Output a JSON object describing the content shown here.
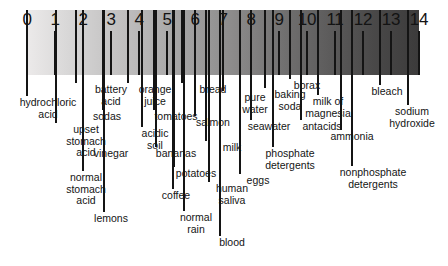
{
  "figure": {
    "name": "ph-scale-diagram",
    "background_color": "#ffffff",
    "bar": {
      "start_color": "#eceaea",
      "end_color": "#3c3b3b",
      "left_px": 27,
      "top_px": 10,
      "width_px": 392,
      "height_px": 65
    },
    "axis": {
      "min": 0,
      "max": 14,
      "tick_labels": [
        "0",
        "1",
        "2",
        "3",
        "4",
        "5",
        "6",
        "7",
        "8",
        "9",
        "10",
        "11",
        "12",
        "13",
        "14"
      ]
    }
  },
  "chart_data": {
    "type": "scatter",
    "title": "",
    "xlabel": "",
    "ylabel": "",
    "xlim": [
      0,
      14
    ],
    "grid": false,
    "legend": "none",
    "categories": [
      "0",
      "1",
      "2",
      "3",
      "4",
      "5",
      "6",
      "7",
      "8",
      "9",
      "10",
      "11",
      "12",
      "13",
      "14"
    ],
    "series": [
      {
        "name": "substances",
        "points": [
          {
            "label": "hydrochloric\nacid",
            "ph": 0.0
          },
          {
            "label": "upset\nstomach\nacid",
            "ph": 1.05
          },
          {
            "label": "battery\nacid",
            "ph": 1.75
          },
          {
            "label": "normal\nstomach\nacid",
            "ph": 2.0
          },
          {
            "label": "sodas",
            "ph": 2.7
          },
          {
            "label": "vinegar",
            "ph": 2.75
          },
          {
            "label": "lemons",
            "ph": 2.75
          },
          {
            "label": "orange\njuice",
            "ph": 3.6
          },
          {
            "label": "acidic\nsoil",
            "ph": 4.1
          },
          {
            "label": "tomatoes",
            "ph": 4.55
          },
          {
            "label": "bananas",
            "ph": 4.6
          },
          {
            "label": "potatoes",
            "ph": 5.25
          },
          {
            "label": "coffee",
            "ph": 5.2
          },
          {
            "label": "bread",
            "ph": 5.55
          },
          {
            "label": "normal\nrain",
            "ph": 5.6
          },
          {
            "label": "salmon",
            "ph": 6.0
          },
          {
            "label": "milk",
            "ph": 6.4
          },
          {
            "label": "human\nsaliva",
            "ph": 6.5
          },
          {
            "label": "blood",
            "ph": 6.9
          },
          {
            "label": "pure\nwater",
            "ph": 7.0
          },
          {
            "label": "eggs",
            "ph": 7.6
          },
          {
            "label": "seawater",
            "ph": 8.0
          },
          {
            "label": "baking\nsoda",
            "ph": 8.5
          },
          {
            "label": "phosphate\ndetergents",
            "ph": 8.8
          },
          {
            "label": "borax",
            "ph": 9.4
          },
          {
            "label": "antacids",
            "ph": 9.8
          },
          {
            "label": "milk of\nmagnesia",
            "ph": 10.4
          },
          {
            "label": "ammonia",
            "ph": 11.2
          },
          {
            "label": "nonphosphate\ndetergents",
            "ph": 11.6
          },
          {
            "label": "bleach",
            "ph": 12.6
          },
          {
            "label": "sodium\nhydroxide",
            "ph": 13.6
          }
        ]
      }
    ]
  },
  "callouts": [
    {
      "name": "callout-hydrochloric-acid",
      "text": "hydrochloric\nacid",
      "ph": 0.0,
      "x": 48,
      "label_y": 97,
      "line_top": 10,
      "line_bottom": 96
    },
    {
      "name": "callout-upset-stomach-acid",
      "text": "upset\nstomach\nacid",
      "ph": 1.05,
      "x": 86,
      "label_y": 124,
      "line_top": 10,
      "line_bottom": 123
    },
    {
      "name": "callout-battery-acid",
      "text": "battery\nacid",
      "ph": 1.75,
      "x": 111,
      "label_y": 84,
      "line_top": 10,
      "line_bottom": 83
    },
    {
      "name": "callout-normal-stomach-acid",
      "text": "normal\nstomach\nacid",
      "ph": 2.0,
      "x": 86,
      "label_y": 172,
      "line_top": 10,
      "line_bottom": 171
    },
    {
      "name": "callout-sodas",
      "text": "sodas",
      "ph": 2.7,
      "x": 107,
      "label_y": 111,
      "line_top": 10,
      "line_bottom": 110
    },
    {
      "name": "callout-vinegar",
      "text": "vinegar",
      "ph": 2.75,
      "x": 111,
      "label_y": 148,
      "line_top": 10,
      "line_bottom": 147
    },
    {
      "name": "callout-lemons",
      "text": "lemons",
      "ph": 2.75,
      "x": 111,
      "label_y": 213,
      "line_top": 10,
      "line_bottom": 212
    },
    {
      "name": "callout-orange-juice",
      "text": "orange\njuice",
      "ph": 3.6,
      "x": 155,
      "label_y": 84,
      "line_top": 10,
      "line_bottom": 83
    },
    {
      "name": "callout-acidic-soil",
      "text": "acidic\nsoil",
      "ph": 4.1,
      "x": 155,
      "label_y": 128,
      "line_top": 10,
      "line_bottom": 127
    },
    {
      "name": "callout-tomatoes",
      "text": "tomatoes",
      "ph": 4.55,
      "x": 176,
      "label_y": 111,
      "line_top": 10,
      "line_bottom": 110
    },
    {
      "name": "callout-bananas",
      "text": "bananas",
      "ph": 4.6,
      "x": 176,
      "label_y": 148,
      "line_top": 10,
      "line_bottom": 147
    },
    {
      "name": "callout-potatoes",
      "text": "potatoes",
      "ph": 5.25,
      "x": 196,
      "label_y": 168,
      "line_top": 10,
      "line_bottom": 167
    },
    {
      "name": "callout-coffee",
      "text": "coffee",
      "ph": 5.2,
      "x": 176,
      "label_y": 190,
      "line_top": 10,
      "line_bottom": 189
    },
    {
      "name": "callout-bread",
      "text": "bread",
      "ph": 5.55,
      "x": 213,
      "label_y": 84,
      "line_top": 10,
      "line_bottom": 83
    },
    {
      "name": "callout-normal-rain",
      "text": "normal\nrain",
      "ph": 5.6,
      "x": 196,
      "label_y": 212,
      "line_top": 10,
      "line_bottom": 211
    },
    {
      "name": "callout-salmon",
      "text": "salmon",
      "ph": 6.0,
      "x": 213,
      "label_y": 117,
      "line_top": 10,
      "line_bottom": 116
    },
    {
      "name": "callout-milk",
      "text": "milk",
      "ph": 6.4,
      "x": 232,
      "label_y": 142,
      "line_top": 10,
      "line_bottom": 141
    },
    {
      "name": "callout-human-saliva",
      "text": "human\nsaliva",
      "ph": 6.5,
      "x": 232,
      "label_y": 183,
      "line_top": 10,
      "line_bottom": 182
    },
    {
      "name": "callout-blood",
      "text": "blood",
      "ph": 6.9,
      "x": 232,
      "label_y": 237,
      "line_top": 10,
      "line_bottom": 236
    },
    {
      "name": "callout-pure-water",
      "text": "pure\nwater",
      "ph": 7.0,
      "x": 255,
      "label_y": 92,
      "line_top": 10,
      "line_bottom": 91
    },
    {
      "name": "callout-eggs",
      "text": "eggs",
      "ph": 7.6,
      "x": 258,
      "label_y": 175,
      "line_top": 10,
      "line_bottom": 174
    },
    {
      "name": "callout-seawater",
      "text": "seawater",
      "ph": 8.0,
      "x": 269,
      "label_y": 121,
      "line_top": 10,
      "line_bottom": 120
    },
    {
      "name": "callout-baking-soda",
      "text": "baking\nsoda",
      "ph": 8.5,
      "x": 290,
      "label_y": 89,
      "line_top": 10,
      "line_bottom": 88
    },
    {
      "name": "callout-phosphate-detergents",
      "text": "phosphate\ndetergents",
      "ph": 8.8,
      "x": 290,
      "label_y": 148,
      "line_top": 10,
      "line_bottom": 147
    },
    {
      "name": "callout-borax",
      "text": "borax",
      "ph": 9.4,
      "x": 307,
      "label_y": 80,
      "line_top": 10,
      "line_bottom": 79
    },
    {
      "name": "callout-antacids",
      "text": "antacids",
      "ph": 9.8,
      "x": 322,
      "label_y": 121,
      "line_top": 10,
      "line_bottom": 120
    },
    {
      "name": "callout-milk-of-magnesia",
      "text": "milk of\nmagnesia",
      "ph": 10.4,
      "x": 328,
      "label_y": 96,
      "line_top": 10,
      "line_bottom": 95
    },
    {
      "name": "callout-ammonia",
      "text": "ammonia",
      "ph": 11.2,
      "x": 352,
      "label_y": 131,
      "line_top": 10,
      "line_bottom": 130
    },
    {
      "name": "callout-nonphosphate-detergents",
      "text": "nonphosphate\ndetergents",
      "ph": 11.6,
      "x": 373,
      "label_y": 167,
      "line_top": 10,
      "line_bottom": 166
    },
    {
      "name": "callout-bleach",
      "text": "bleach",
      "ph": 12.6,
      "x": 387,
      "label_y": 86,
      "line_top": 10,
      "line_bottom": 85
    },
    {
      "name": "callout-sodium-hydroxide",
      "text": "sodium\nhydroxide",
      "ph": 13.6,
      "x": 412,
      "label_y": 106,
      "line_top": 10,
      "line_bottom": 105
    }
  ]
}
